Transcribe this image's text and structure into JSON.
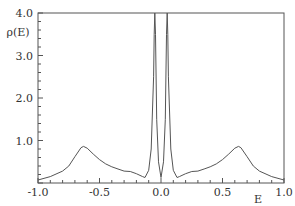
{
  "chart_data": {
    "type": "line",
    "title": "",
    "xlabel": "E",
    "ylabel": "ρ(E)",
    "xlim": [
      -1.0,
      1.0
    ],
    "ylim": [
      0.0,
      4.0
    ],
    "grid": false,
    "legend": null,
    "x_ticks": [
      "-1.0",
      "-0.5",
      "0.0",
      "0.5",
      "1.0"
    ],
    "y_ticks": [
      "1.0",
      "2.0",
      "3.0",
      "4.0"
    ],
    "series": [
      {
        "name": "rho(E)",
        "x": [
          -1.0,
          -0.9,
          -0.8,
          -0.75,
          -0.7,
          -0.65,
          -0.63,
          -0.6,
          -0.55,
          -0.5,
          -0.45,
          -0.4,
          -0.35,
          -0.3,
          -0.25,
          -0.2,
          -0.15,
          -0.13,
          -0.1,
          -0.08,
          -0.06,
          -0.055,
          -0.05,
          -0.045,
          -0.035,
          -0.02,
          0.0,
          0.02,
          0.035,
          0.045,
          0.05,
          0.055,
          0.06,
          0.08,
          0.1,
          0.13,
          0.15,
          0.2,
          0.25,
          0.3,
          0.35,
          0.4,
          0.45,
          0.5,
          0.55,
          0.6,
          0.63,
          0.65,
          0.7,
          0.75,
          0.8,
          0.9,
          1.0
        ],
        "values": [
          0.07,
          0.15,
          0.28,
          0.4,
          0.62,
          0.83,
          0.86,
          0.82,
          0.68,
          0.55,
          0.45,
          0.38,
          0.33,
          0.28,
          0.27,
          0.22,
          0.15,
          0.13,
          0.3,
          0.8,
          2.5,
          3.5,
          4.0,
          3.5,
          1.5,
          0.5,
          0.13,
          0.5,
          1.5,
          3.5,
          4.0,
          3.5,
          2.5,
          0.8,
          0.3,
          0.13,
          0.15,
          0.22,
          0.27,
          0.28,
          0.33,
          0.38,
          0.45,
          0.55,
          0.68,
          0.82,
          0.86,
          0.83,
          0.62,
          0.4,
          0.28,
          0.15,
          0.07
        ]
      }
    ]
  },
  "axes": {
    "xlabel": "E",
    "ylabel": "ρ(E)",
    "x_ticks": [
      {
        "label": "-1.0",
        "value": -1.0
      },
      {
        "label": "-0.5",
        "value": -0.5
      },
      {
        "label": "0.0",
        "value": 0.0
      },
      {
        "label": "0.5",
        "value": 0.5
      },
      {
        "label": "1.0",
        "value": 1.0
      }
    ],
    "y_ticks": [
      {
        "label": "1.0",
        "value": 1.0
      },
      {
        "label": "2.0",
        "value": 2.0
      },
      {
        "label": "3.0",
        "value": 3.0
      },
      {
        "label": "4.0",
        "value": 4.0
      }
    ]
  },
  "colors": {
    "line": "#555555",
    "axis": "#555555",
    "text": "#333333"
  }
}
